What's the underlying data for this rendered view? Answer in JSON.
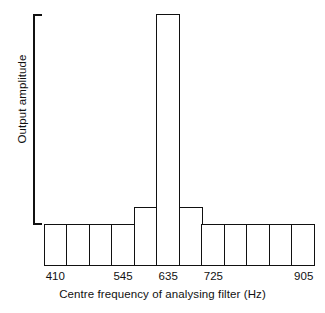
{
  "chart_data": {
    "type": "bar",
    "title": "",
    "xlabel": "Centre frequency of analysing filter (Hz)",
    "ylabel": "Output amplitude",
    "grid": false,
    "legend": "none",
    "ylim": [
      0,
      1
    ],
    "note": "Histogram of filter output amplitude versus analysing filter centre frequency; sharp peak at 635 Hz with small shoulders either side and a uniform low baseline elsewhere.",
    "categories": [
      "410",
      "455",
      "500",
      "545",
      "590",
      "635",
      "680",
      "725",
      "770",
      "815",
      "860",
      "905"
    ],
    "tick_labels": [
      "410",
      "545",
      "635",
      "725",
      "905"
    ],
    "tick_indices": [
      0,
      3,
      5,
      7,
      11
    ],
    "values": [
      0.167,
      0.167,
      0.167,
      0.167,
      0.234,
      1.0,
      0.234,
      0.167,
      0.167,
      0.167,
      0.167,
      0.167
    ],
    "bar_count": 12,
    "peak_category": "635",
    "peak_value": 1.0,
    "baseline_value": 0.167,
    "shoulder_value": 0.234
  },
  "axes": {
    "y_bracket_label": "Output amplitude",
    "x_title": "Centre frequency of analysing filter (Hz)"
  },
  "style": {
    "line_color": "#111111",
    "bar_fill": "#ffffff",
    "background": "#ffffff"
  }
}
